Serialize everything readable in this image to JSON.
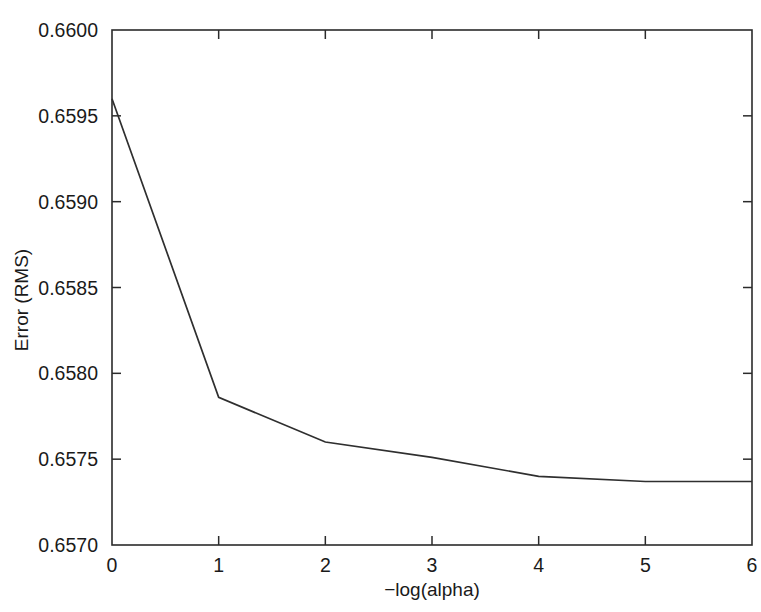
{
  "figure": {
    "background_color": "#ffffff",
    "line_color": "#2f2f2f",
    "axis_color": "#2b2b2b",
    "text_color": "#1a1a1a",
    "caption_fragment": ""
  },
  "chart_data": {
    "type": "line",
    "title": "",
    "xlabel": "−log(alpha)",
    "ylabel": "Error (RMS)",
    "xlim": [
      0,
      6
    ],
    "ylim": [
      0.657,
      0.66
    ],
    "grid": false,
    "legend": false,
    "x": [
      0,
      1,
      2,
      3,
      4,
      5,
      6
    ],
    "values": [
      0.6596,
      0.65786,
      0.6576,
      0.65751,
      0.6574,
      0.65737,
      0.65737
    ],
    "series": [
      {
        "name": "Error (RMS)",
        "values": [
          0.6596,
          0.65786,
          0.6576,
          0.65751,
          0.6574,
          0.65737,
          0.65737
        ]
      }
    ],
    "xticks": [
      0,
      1,
      2,
      3,
      4,
      5,
      6
    ],
    "xtick_labels": [
      "0",
      "1",
      "2",
      "3",
      "4",
      "5",
      "6"
    ],
    "yticks": [
      0.657,
      0.6575,
      0.658,
      0.6585,
      0.659,
      0.6595,
      0.66
    ],
    "ytick_labels": [
      "0.6570",
      "0.6575",
      "0.6580",
      "0.6585",
      "0.6590",
      "0.6595",
      "0.6600"
    ]
  }
}
